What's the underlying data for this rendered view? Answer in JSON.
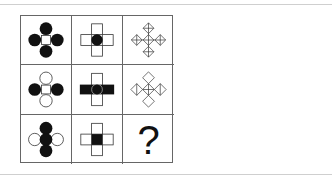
{
  "puzzle": {
    "type": "3x3 figure reasoning matrix",
    "cells": [
      {
        "row": 1,
        "col": 1,
        "description": "square center with four filled black circles (top, bottom, left, right)"
      },
      {
        "row": 1,
        "col": 2,
        "description": "outlined cross of rectangles with filled black circle in center"
      },
      {
        "row": 1,
        "col": 3,
        "description": "five small diamonds with cross lines arranged in a plus shape"
      },
      {
        "row": 2,
        "col": 1,
        "description": "square center with filled circles left/right and hollow circles top/bottom"
      },
      {
        "row": 2,
        "col": 2,
        "description": "outlined cross with black horizontal bar and circle in center"
      },
      {
        "row": 2,
        "col": 3,
        "description": "plus arrangement of diamonds, some with half lines"
      },
      {
        "row": 3,
        "col": 1,
        "description": "filled circles vertical column with hollow circles left/right"
      },
      {
        "row": 3,
        "col": 2,
        "description": "outlined cross with filled black square center"
      },
      {
        "row": 3,
        "col": 3,
        "description": "question mark",
        "label": "?"
      }
    ],
    "question_mark": "?"
  },
  "colors": {
    "stroke": "#333333",
    "fill": "#111111",
    "grid_border": "#666666",
    "rule_line": "#cfcfcf"
  }
}
